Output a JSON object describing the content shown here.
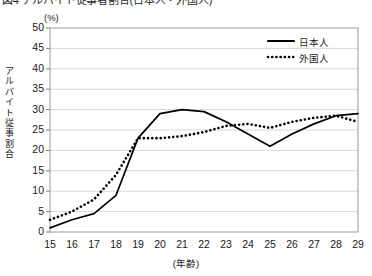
{
  "caption": {
    "text": "図4 アルバイト従事者割合(日本人・外国人)"
  },
  "chart_data": {
    "type": "line",
    "title": "",
    "unit_label": "(%)",
    "ylabel": "アルバイト従事割合",
    "ylabel_chars": [
      "ア",
      "ル",
      "バ",
      "イ",
      "ト",
      "従",
      "事",
      "割",
      "合"
    ],
    "xlabel": "(年齢)",
    "x": [
      15,
      16,
      17,
      18,
      19,
      20,
      21,
      22,
      23,
      24,
      25,
      26,
      27,
      28,
      29
    ],
    "categories": [
      "15",
      "16",
      "17",
      "18",
      "19",
      "20",
      "21",
      "22",
      "23",
      "24",
      "25",
      "26",
      "27",
      "28",
      "29"
    ],
    "xlim": [
      15,
      29
    ],
    "ylim": [
      0,
      50
    ],
    "yticks": [
      0,
      5,
      10,
      15,
      20,
      25,
      30,
      35,
      40,
      45,
      50
    ],
    "ytick_labels": [
      "0",
      "5",
      "10",
      "15",
      "20",
      "25",
      "30",
      "35",
      "40",
      "45",
      "50"
    ],
    "grid": "horizontal",
    "legend_position": "top-right",
    "series": [
      {
        "name": "日本人",
        "style": "solid",
        "color": "#000000",
        "values": [
          1,
          3,
          4.5,
          9,
          23,
          29,
          30,
          29.5,
          27,
          24,
          21,
          24,
          26.5,
          28.5,
          29
        ]
      },
      {
        "name": "外国人",
        "style": "dotted",
        "color": "#000000",
        "values": [
          3,
          5,
          8,
          14,
          23,
          23,
          23.5,
          24.5,
          26,
          26.5,
          25.5,
          27,
          28,
          28.5,
          27
        ]
      }
    ]
  },
  "legend": {
    "items": [
      {
        "label": "日本人",
        "style": "solid"
      },
      {
        "label": "外国人",
        "style": "dotted"
      }
    ]
  }
}
